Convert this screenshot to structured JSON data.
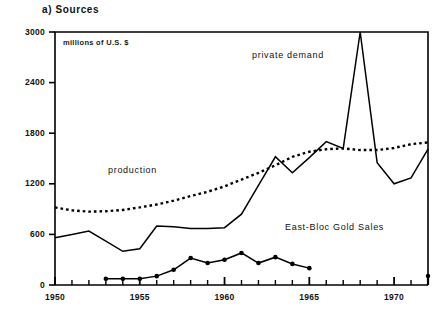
{
  "chart_data": {
    "type": "line",
    "title": "a) Sources",
    "subtitle": "millions of U.S. $",
    "xlabel": "",
    "ylabel": "",
    "ylim": [
      0,
      3000
    ],
    "xlim": [
      1950,
      1972
    ],
    "yticks": [
      0,
      600,
      1200,
      1800,
      2400,
      3000
    ],
    "ytick_labels": [
      "0",
      "600",
      "1200",
      "1800",
      "2400",
      "3000"
    ],
    "xticks": [
      1950,
      1955,
      1960,
      1965,
      1970
    ],
    "xtick_labels": [
      "1950",
      "1955",
      "1960",
      "1965",
      "1970"
    ],
    "minor_xticks_every": 1,
    "grid": false,
    "legend_position": "inline-annotations",
    "annotations": [
      {
        "text": "private demand",
        "x": 1963.2,
        "y": 2760
      },
      {
        "text": "production",
        "x": 1953.4,
        "y": 1290
      },
      {
        "text": "East-Bloc Gold Sales",
        "x": 1962.6,
        "y": 700
      }
    ],
    "series": [
      {
        "name": "private demand",
        "style": "solid",
        "markers": false,
        "x": [
          1950,
          1951,
          1952,
          1953,
          1954,
          1955,
          1956,
          1957,
          1958,
          1959,
          1960,
          1961,
          1962,
          1963,
          1964,
          1965,
          1966,
          1967,
          1968,
          1969,
          1970,
          1971,
          1972
        ],
        "values": [
          560,
          600,
          640,
          520,
          400,
          430,
          700,
          690,
          670,
          670,
          680,
          840,
          1180,
          1520,
          1330,
          1510,
          1700,
          1620,
          3000,
          1450,
          1200,
          1270,
          1610
        ]
      },
      {
        "name": "production",
        "style": "dotted",
        "markers": false,
        "x": [
          1950,
          1951,
          1952,
          1953,
          1954,
          1955,
          1956,
          1957,
          1958,
          1959,
          1960,
          1961,
          1962,
          1963,
          1964,
          1965,
          1966,
          1967,
          1968,
          1969,
          1970,
          1971,
          1972
        ],
        "values": [
          920,
          885,
          870,
          875,
          890,
          920,
          955,
          1000,
          1055,
          1105,
          1170,
          1250,
          1330,
          1420,
          1520,
          1580,
          1610,
          1620,
          1600,
          1600,
          1625,
          1670,
          1690
        ]
      },
      {
        "name": "East-Bloc Gold Sales",
        "style": "solid",
        "markers": true,
        "x": [
          1953,
          1954,
          1955,
          1956,
          1957,
          1958,
          1959,
          1960,
          1961,
          1962,
          1963,
          1964,
          1965
        ],
        "values": [
          75,
          75,
          75,
          105,
          180,
          320,
          260,
          300,
          380,
          260,
          330,
          250,
          200
        ]
      }
    ],
    "axis_end_marker": {
      "x": 1972,
      "y": 0,
      "present": true
    },
    "colors": {
      "line": "#000000",
      "axis": "#000000",
      "background": "#ffffff"
    }
  }
}
